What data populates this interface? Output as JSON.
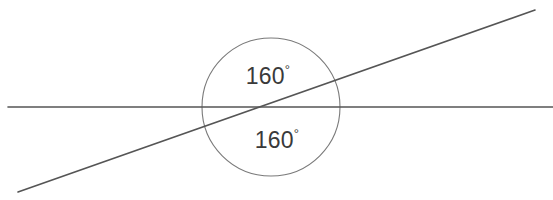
{
  "figure": {
    "background_color": "#ffffff",
    "width": 553,
    "height": 200
  },
  "style": {
    "line_color": "#555555",
    "circle_color": "#7a7a7a",
    "text_color": "#3a3a3a",
    "line_width": 1.6,
    "circle_width": 1.1
  },
  "chart_data": {
    "type": "diagram",
    "shapes": [
      {
        "name": "horizontal-line",
        "kind": "line",
        "x1": 8,
        "y1": 107,
        "x2": 553,
        "y2": 107,
        "color": "#555555"
      },
      {
        "name": "transversal-line",
        "kind": "line",
        "x1": 18,
        "y1": 192,
        "x2": 535,
        "y2": 10,
        "color": "#555555"
      },
      {
        "name": "angle-circle",
        "kind": "circle",
        "cx": 271,
        "cy": 107,
        "r": 69,
        "color": "#7a7a7a"
      }
    ],
    "intersection": {
      "x": 271,
      "y": 107
    },
    "labels": [
      {
        "name": "upper-angle-label",
        "value": 160,
        "unit": "degrees",
        "text": "160",
        "symbol": "°",
        "x": 268,
        "y": 78
      },
      {
        "name": "lower-angle-label",
        "value": 160,
        "unit": "degrees",
        "text": "160",
        "symbol": "°",
        "x": 277,
        "y": 142
      }
    ]
  }
}
